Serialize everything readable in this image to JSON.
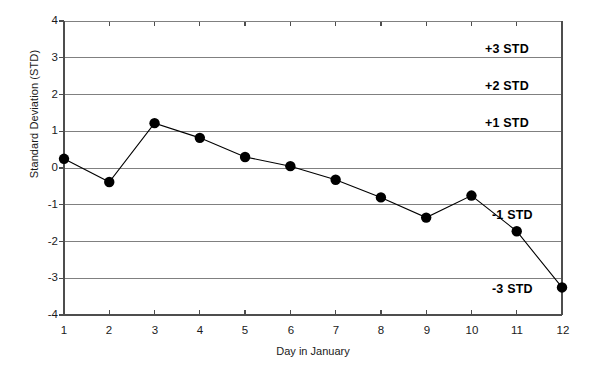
{
  "chart_data": {
    "type": "line",
    "title": "",
    "xlabel": "Day in January",
    "ylabel": "Standard Deviation (STD)",
    "x": [
      1,
      2,
      3,
      4,
      5,
      6,
      7,
      8,
      9,
      10,
      11,
      12
    ],
    "values": [
      0.25,
      -0.38,
      1.22,
      0.82,
      0.3,
      0.05,
      -0.32,
      -0.8,
      -1.35,
      -0.75,
      -1.72,
      -3.25
    ],
    "series": [
      {
        "name": "Standard deviation",
        "values": [
          0.25,
          -0.38,
          1.22,
          0.82,
          0.3,
          0.05,
          -0.32,
          -0.8,
          -1.35,
          -0.75,
          -1.72,
          -3.25
        ]
      }
    ],
    "xlim": [
      1,
      12
    ],
    "ylim": [
      -4,
      4
    ],
    "xticks": [
      "1",
      "2",
      "3",
      "4",
      "5",
      "6",
      "7",
      "8",
      "9",
      "10",
      "11",
      "12"
    ],
    "yticks": [
      "4",
      "3",
      "2",
      "1",
      "0",
      "-1",
      "-2",
      "-3",
      "-4"
    ],
    "grid": "horizontal",
    "legend": "none",
    "marker": "filled-circle",
    "line_color": "#000000",
    "marker_color": "#000000",
    "grid_color": "#808080",
    "axis_color": "#4d4d4d",
    "annotations": [
      {
        "text": "+3 STD",
        "y": 3,
        "placement": "above-line"
      },
      {
        "text": "+2 STD",
        "y": 2,
        "placement": "above-line"
      },
      {
        "text": "+1 STD",
        "y": 1,
        "placement": "above-line"
      },
      {
        "text": "-1 STD",
        "y": -1,
        "placement": "below-line"
      },
      {
        "text": "-3 STD",
        "y": -3,
        "placement": "below-line"
      }
    ]
  }
}
